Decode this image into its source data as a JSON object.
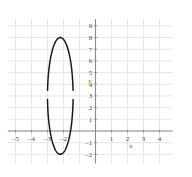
{
  "figure": {
    "background_color": "#ffffff",
    "grid_color": "#e3e3e8",
    "axis_color": "#8a8a92",
    "curve_color": "#1a1a1a"
  },
  "axes": {
    "x_axis_label": "x",
    "y_axis_label": "y",
    "x_label_position": {
      "x": 2.2,
      "y": -1.45
    },
    "y_label_position": {
      "x": -0.35,
      "y": 4.15
    },
    "x_ticks": [
      {
        "value": -5,
        "label": "–5"
      },
      {
        "value": -4,
        "label": "–4"
      },
      {
        "value": -3,
        "label": "–3"
      },
      {
        "value": -2,
        "label": "–2"
      },
      {
        "value": 1,
        "label": "1"
      },
      {
        "value": 2,
        "label": "2"
      },
      {
        "value": 3,
        "label": "3"
      },
      {
        "value": 4,
        "label": "4"
      }
    ],
    "y_ticks": [
      {
        "value": 9,
        "label": "9"
      },
      {
        "value": 8,
        "label": "8"
      },
      {
        "value": 7,
        "label": "7"
      },
      {
        "value": 6,
        "label": "6"
      },
      {
        "value": 5,
        "label": "5"
      },
      {
        "value": 4,
        "label": "4"
      },
      {
        "value": 3,
        "label": "3"
      },
      {
        "value": 2,
        "label": "2"
      },
      {
        "value": 1,
        "label": "1"
      },
      {
        "value": -1,
        "label": "–1"
      },
      {
        "value": -2,
        "label": "–2"
      }
    ],
    "xlim": [
      -5.6,
      4.7
    ],
    "ylim": [
      -2.6,
      9.4
    ],
    "grid": true
  },
  "chart_data": {
    "type": "line",
    "title": "",
    "xlabel": "x",
    "ylabel": "y",
    "xlim": [
      -5.6,
      4.7
    ],
    "ylim": [
      -2.6,
      9.4
    ],
    "grid": true,
    "series": [
      {
        "name": "ellipse",
        "shape": "ellipse",
        "center": [
          -2.2,
          3.0
        ],
        "semi_axis_x": 0.8,
        "semi_axis_y": 5.0,
        "x_extent": [
          -3.0,
          -1.4
        ],
        "y_extent": [
          -2.0,
          8.0
        ],
        "style": "solid-with-gaps",
        "gaps": [
          {
            "y_from": 2.75,
            "y_to": 3.45,
            "side": "left"
          },
          {
            "y_from": 2.75,
            "y_to": 3.45,
            "side": "right"
          }
        ],
        "color": "#1a1a1a"
      }
    ],
    "annotations": [
      {
        "text": "y",
        "x": -0.35,
        "y": 4.15
      },
      {
        "text": "x",
        "x": 2.2,
        "y": -1.45
      }
    ]
  }
}
